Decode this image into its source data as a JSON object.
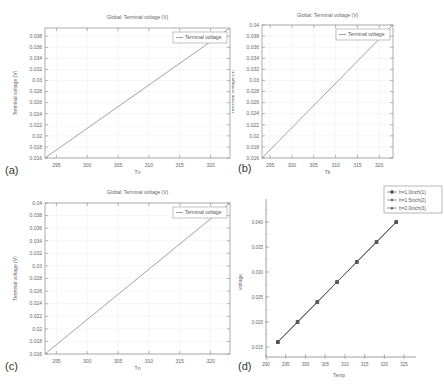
{
  "panels": {
    "a": {
      "tag": "(a)"
    },
    "b": {
      "tag": "(b)"
    },
    "c": {
      "tag": "(c)"
    },
    "d": {
      "tag": "(d)"
    }
  },
  "chart_data": [
    {
      "id": "a",
      "type": "line",
      "title": "Global: Terminal voltage (V)",
      "xlabel": "Tn",
      "ylabel": "Terminal voltage (V)",
      "xticks": [
        295,
        300,
        305,
        310,
        315,
        320
      ],
      "yticks": [
        0.016,
        0.018,
        0.02,
        0.022,
        0.024,
        0.026,
        0.028,
        0.03,
        0.032,
        0.034,
        0.036,
        0.038
      ],
      "xlim": [
        293.15,
        323.15
      ],
      "ylim": [
        0.016,
        0.0395
      ],
      "grid": true,
      "legend": {
        "position": "upper right",
        "entries": [
          "Terminal voltage"
        ]
      },
      "series": [
        {
          "name": "Terminal voltage",
          "x": [
            293.15,
            323.15
          ],
          "y": [
            0.016,
            0.0395
          ]
        }
      ]
    },
    {
      "id": "b",
      "type": "line",
      "title": "Global: Terminal voltage (V)",
      "xlabel": "Tk",
      "ylabel": "Terminal voltage (V)",
      "xticks": [
        295,
        300,
        305,
        310,
        315,
        320
      ],
      "yticks": [
        0.016,
        0.018,
        0.02,
        0.022,
        0.024,
        0.026,
        0.028,
        0.03,
        0.032,
        0.034,
        0.036,
        0.038,
        0.04
      ],
      "xlim": [
        293.15,
        323.15
      ],
      "ylim": [
        0.016,
        0.04
      ],
      "grid": true,
      "legend": {
        "position": "upper right",
        "entries": [
          "Terminal voltage"
        ]
      },
      "series": [
        {
          "name": "Terminal voltage",
          "x": [
            293.15,
            323.15
          ],
          "y": [
            0.016,
            0.04
          ]
        }
      ]
    },
    {
      "id": "c",
      "type": "line",
      "title": "Global: Terminal voltage (V)",
      "xlabel": "Tn",
      "ylabel": "Terminal voltage (V)",
      "xticks": [
        295,
        300,
        305,
        310,
        315,
        320
      ],
      "yticks": [
        0.016,
        0.018,
        0.02,
        0.022,
        0.024,
        0.026,
        0.028,
        0.03,
        0.032,
        0.034,
        0.036,
        0.038,
        0.04
      ],
      "xlim": [
        293.15,
        323.15
      ],
      "ylim": [
        0.016,
        0.04
      ],
      "grid": true,
      "legend": {
        "position": "upper right",
        "entries": [
          "Terminal voltage"
        ]
      },
      "series": [
        {
          "name": "Terminal voltage",
          "x": [
            293.15,
            323.15
          ],
          "y": [
            0.016,
            0.04
          ]
        }
      ]
    },
    {
      "id": "d",
      "type": "line",
      "title": "",
      "xlabel": "Temp",
      "ylabel": "voltage",
      "xticks": [
        290,
        295,
        300,
        305,
        310,
        315,
        320,
        325
      ],
      "yticks": [
        0.015,
        0.02,
        0.025,
        0.03,
        0.035,
        0.04
      ],
      "xlim": [
        290,
        327
      ],
      "ylim": [
        0.013,
        0.043
      ],
      "grid": false,
      "legend": {
        "position": "upper right",
        "entries": [
          "h=1.0inch(1)",
          "h=1.5inch(2)",
          "h=2.0inch(3)"
        ]
      },
      "series": [
        {
          "name": "h=1.0inch(1)",
          "marker": "square",
          "x": [
            293,
            298,
            303,
            308,
            313,
            318,
            323
          ],
          "y": [
            0.016,
            0.02,
            0.024,
            0.028,
            0.032,
            0.036,
            0.04
          ]
        },
        {
          "name": "h=1.5inch(2)",
          "marker": "circle",
          "x": [
            293,
            298,
            303,
            308,
            313,
            318,
            323
          ],
          "y": [
            0.016,
            0.02,
            0.024,
            0.028,
            0.032,
            0.036,
            0.04
          ]
        },
        {
          "name": "h=2.0inch(3)",
          "marker": "triangle",
          "x": [
            293,
            298,
            303,
            308,
            313,
            318,
            323
          ],
          "y": [
            0.016,
            0.02,
            0.024,
            0.028,
            0.032,
            0.036,
            0.04
          ]
        }
      ]
    }
  ]
}
